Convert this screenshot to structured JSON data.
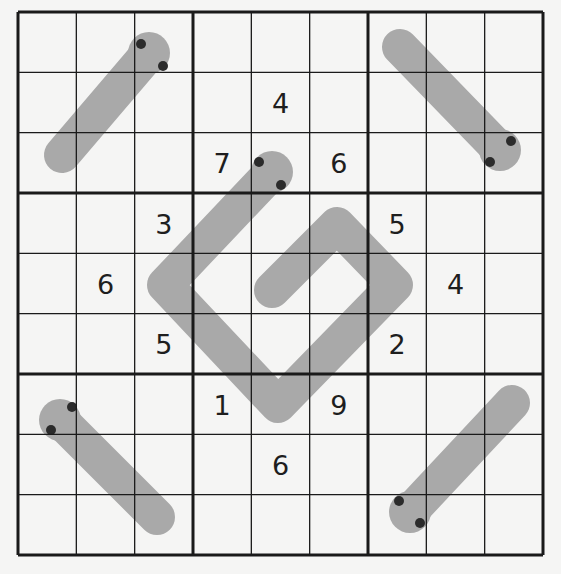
{
  "puzzle": {
    "type": "Thermo Sudoku",
    "size": 9,
    "colors": {
      "background": "#f5f5f4",
      "grid_line": "#1a1a1a",
      "thermo_fill": "#a9a9a9",
      "bulb_dot": "#2b2b2b",
      "digit": "#1e1e1e"
    },
    "givens": [
      {
        "row": 2,
        "col": 5,
        "value": "4"
      },
      {
        "row": 3,
        "col": 4,
        "value": "7"
      },
      {
        "row": 3,
        "col": 6,
        "value": "6"
      },
      {
        "row": 4,
        "col": 3,
        "value": "3"
      },
      {
        "row": 4,
        "col": 7,
        "value": "5"
      },
      {
        "row": 5,
        "col": 2,
        "value": "6"
      },
      {
        "row": 5,
        "col": 8,
        "value": "4"
      },
      {
        "row": 6,
        "col": 3,
        "value": "5"
      },
      {
        "row": 6,
        "col": 7,
        "value": "2"
      },
      {
        "row": 7,
        "col": 4,
        "value": "1"
      },
      {
        "row": 7,
        "col": 6,
        "value": "9"
      },
      {
        "row": 8,
        "col": 5,
        "value": "6"
      }
    ],
    "thermometers": [
      {
        "name": "thermo-top-left",
        "cells": [
          [
            1,
            3
          ],
          [
            2,
            2
          ],
          [
            3,
            1
          ]
        ]
      },
      {
        "name": "thermo-top-right",
        "cells": [
          [
            3,
            9
          ],
          [
            2,
            8
          ],
          [
            1,
            7
          ]
        ]
      },
      {
        "name": "thermo-center-spiral",
        "cells": [
          [
            3,
            5
          ],
          [
            4,
            4
          ],
          [
            5,
            3
          ],
          [
            6,
            4
          ],
          [
            7,
            5
          ],
          [
            6,
            6
          ],
          [
            5,
            7
          ],
          [
            4,
            6
          ],
          [
            5,
            5
          ]
        ]
      },
      {
        "name": "thermo-bottom-left",
        "cells": [
          [
            7,
            1
          ],
          [
            8,
            2
          ],
          [
            9,
            3
          ]
        ]
      },
      {
        "name": "thermo-bottom-right",
        "cells": [
          [
            9,
            7
          ],
          [
            8,
            8
          ],
          [
            7,
            9
          ]
        ]
      }
    ]
  }
}
